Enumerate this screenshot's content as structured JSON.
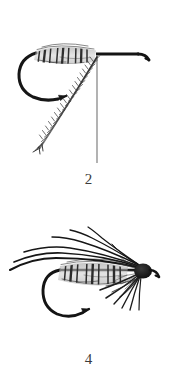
{
  "page": {
    "background_color": "#ffffff",
    "ink_color": "#1a1a1a",
    "mid_ink_color": "#4a4a4a",
    "light_ink_color": "#8a8a8a",
    "width": 177,
    "height": 391
  },
  "figures": [
    {
      "id": "step-2",
      "caption": "2",
      "title": "fly-tying step 2 diagram",
      "subject": "bare hook with ribbed body and tied-in soft hackle feather",
      "leader_line": {
        "visible": true,
        "orientation": "vertical",
        "from": [
          97,
          55
        ],
        "to": [
          97,
          163
        ]
      },
      "parts": [
        {
          "name": "hook-shank",
          "label": "hook shank"
        },
        {
          "name": "hook-eye",
          "label": "turned-down hook eye"
        },
        {
          "name": "hook-bend",
          "label": "hook bend"
        },
        {
          "name": "hook-point",
          "label": "hook point and barb"
        },
        {
          "name": "ribbed-body",
          "label": "ribbed body, 3 segments"
        },
        {
          "name": "hackle-feather",
          "label": "hackle feather tied in at head"
        }
      ],
      "body_segments": 3
    },
    {
      "id": "step-4",
      "caption": "4",
      "title": "fly-tying step 4 diagram",
      "subject": "completed soft-hackle wet fly with swept wing and collar hackle",
      "leader_line": {
        "visible": false
      },
      "parts": [
        {
          "name": "hook-shank",
          "label": "hook shank"
        },
        {
          "name": "hook-eye",
          "label": "turned-down hook eye"
        },
        {
          "name": "hook-bend",
          "label": "hook bend"
        },
        {
          "name": "hook-point",
          "label": "hook point and barb"
        },
        {
          "name": "ribbed-body",
          "label": "ribbed body, 3 segments"
        },
        {
          "name": "wing-fibers",
          "label": "swept-back wing fibers"
        },
        {
          "name": "hackle-collar",
          "label": "splayed hackle collar"
        },
        {
          "name": "fly-head",
          "label": "dark thread head"
        }
      ],
      "body_segments": 3,
      "wing_fiber_count": 6,
      "hackle_fiber_count": 9
    }
  ]
}
